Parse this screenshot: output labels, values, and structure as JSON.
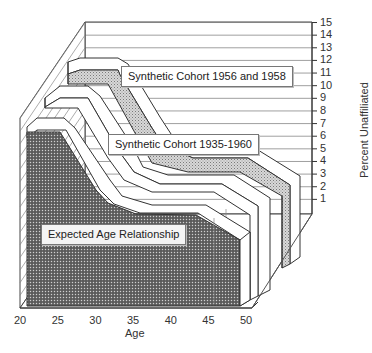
{
  "chart_data": {
    "type": "area",
    "variant": "3d-ribbon",
    "title": "",
    "xlabel": "Age",
    "ylabel": "Percent Unaffiliated",
    "x": [
      20,
      25,
      30,
      35,
      40,
      45,
      50
    ],
    "x_ticks": [
      "20",
      "25",
      "30",
      "35",
      "40",
      "45",
      "50"
    ],
    "y_ticks": [
      "1",
      "2",
      "3",
      "4",
      "5",
      "6",
      "7",
      "8",
      "9",
      "10",
      "11",
      "12",
      "13",
      "14",
      "15"
    ],
    "ylim": [
      0,
      15
    ],
    "xlim": [
      20,
      50
    ],
    "grid": true,
    "legend_position": "inline callouts",
    "series": [
      {
        "name": "Expected Age Relationship",
        "fill": "dark-stipple",
        "x": [
          20,
          24,
          28,
          32,
          36,
          40,
          44,
          50
        ],
        "values": [
          12.5,
          12.5,
          10.5,
          8.5,
          7.8,
          7.0,
          6.0,
          4.5
        ]
      },
      {
        "name": "Synthetic Cohort 1935-1960",
        "fill": "white",
        "x": [
          20,
          24,
          28,
          32,
          36,
          40,
          44,
          50
        ],
        "values": [
          12.5,
          12.5,
          10.5,
          8.0,
          7.5,
          6.5,
          6.5,
          5.0
        ]
      },
      {
        "name": "Synthetic Cohort 1956 and 1958",
        "fill": "light-stipple",
        "x": [
          20,
          24,
          28,
          32,
          36,
          40,
          44,
          50
        ],
        "values": [
          12.5,
          12.5,
          10.5,
          8.0,
          7.0,
          6.5,
          6.5,
          5.0
        ]
      }
    ]
  },
  "labels": {
    "callout_back": "Synthetic Cohort 1956 and  1958",
    "callout_middle": "Synthetic Cohort   1935-1960",
    "callout_front": "Expected Age Relationship",
    "x_axis_title": "Age",
    "y_axis_title": "Percent Unaffiliated"
  },
  "colors": {
    "line": "#333333",
    "dark_fill": "#555555",
    "light_fill": "#bdbdbd",
    "ribbon_top": "#ffffff"
  }
}
